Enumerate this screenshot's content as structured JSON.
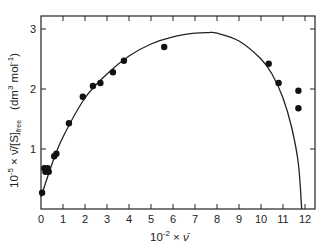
{
  "chart_data": {
    "type": "scatter",
    "title": "",
    "xlabel": "10^-2 × ν̄",
    "ylabel": "10^-5 × ν̄/[S]free (dm^3 mol^-1)",
    "xlim": [
      0,
      12.5
    ],
    "ylim": [
      0,
      3.2
    ],
    "xticks": [
      0,
      1,
      2,
      3,
      4,
      5,
      6,
      7,
      8,
      9,
      10,
      11,
      12
    ],
    "yticks": [
      1,
      2,
      3
    ],
    "grid": false,
    "legend": null,
    "series": [
      {
        "name": "measured",
        "kind": "points",
        "x": [
          0.05,
          0.15,
          0.2,
          0.3,
          0.35,
          0.6,
          0.7,
          1.27,
          1.9,
          2.36,
          2.7,
          3.27,
          3.77,
          5.6,
          10.35,
          10.8,
          11.7,
          11.7
        ],
        "y": [
          0.27,
          0.68,
          0.62,
          0.68,
          0.62,
          0.88,
          0.92,
          1.43,
          1.87,
          2.05,
          2.1,
          2.28,
          2.47,
          2.7,
          2.42,
          2.1,
          1.97,
          1.68
        ]
      },
      {
        "name": "fit",
        "kind": "line",
        "x": [
          0,
          0.5,
          1,
          2,
          3,
          4,
          5,
          6,
          7,
          7.6,
          8,
          9,
          10,
          10.5,
          11,
          11.4,
          11.7,
          11.85
        ],
        "y": [
          0.2,
          0.75,
          1.2,
          1.85,
          2.25,
          2.55,
          2.75,
          2.87,
          2.93,
          2.94,
          2.93,
          2.8,
          2.5,
          2.25,
          1.85,
          1.35,
          0.75,
          0.0
        ]
      }
    ]
  },
  "labels": {
    "x_axis_prefix": "10",
    "x_axis_exp": "-2",
    "x_axis_mid": " × ",
    "x_axis_var": "ν̄",
    "y_axis_prefix": "10",
    "y_axis_exp": "-5",
    "y_axis_mid": " × ν̄/[S]",
    "y_axis_sub": "free",
    "y_axis_units": "(dm",
    "y_axis_units_exp": "3",
    "y_axis_units_mid": " mol",
    "y_axis_units_exp2": "-1",
    "y_axis_units_end": ")"
  }
}
